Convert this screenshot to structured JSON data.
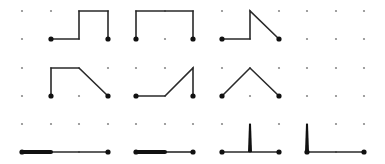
{
  "grid": {
    "columns_x": [
      22,
      51,
      79,
      108,
      136,
      165,
      193,
      222,
      250,
      279,
      307,
      336,
      364
    ],
    "rows_y": [
      11,
      39,
      68,
      96,
      124,
      152
    ],
    "dot_color": "#8a8a8a",
    "dot_radius": 1.1
  },
  "colors": {
    "line": "#2a2a2a",
    "endpoint": "#111111"
  },
  "panels": [
    {
      "id": "p1",
      "row": 1,
      "col": 1,
      "type": "polyline",
      "points": [
        [
          51,
          39
        ],
        [
          79,
          39
        ],
        [
          79,
          11
        ],
        [
          108,
          11
        ],
        [
          108,
          39
        ]
      ],
      "endpoints": [
        [
          51,
          39
        ],
        [
          108,
          39
        ]
      ]
    },
    {
      "id": "p2",
      "row": 1,
      "col": 2,
      "type": "polyline",
      "points": [
        [
          136,
          39
        ],
        [
          136,
          11
        ],
        [
          193,
          11
        ],
        [
          193,
          39
        ]
      ],
      "endpoints": [
        [
          136,
          39
        ],
        [
          193,
          39
        ]
      ]
    },
    {
      "id": "p3",
      "row": 1,
      "col": 3,
      "type": "polyline",
      "points": [
        [
          222,
          39
        ],
        [
          250,
          39
        ],
        [
          250,
          11
        ],
        [
          279,
          39
        ]
      ],
      "endpoints": [
        [
          222,
          39
        ],
        [
          279,
          39
        ]
      ]
    },
    {
      "id": "p4",
      "row": 1,
      "col": 4,
      "type": "empty"
    },
    {
      "id": "p5",
      "row": 2,
      "col": 1,
      "type": "polyline",
      "points": [
        [
          51,
          96
        ],
        [
          51,
          68
        ],
        [
          79,
          68
        ],
        [
          108,
          96
        ]
      ],
      "endpoints": [
        [
          51,
          96
        ],
        [
          108,
          96
        ]
      ]
    },
    {
      "id": "p6",
      "row": 2,
      "col": 2,
      "type": "polyline",
      "points": [
        [
          136,
          96
        ],
        [
          165,
          96
        ],
        [
          193,
          68
        ],
        [
          193,
          96
        ]
      ],
      "endpoints": [
        [
          136,
          96
        ],
        [
          193,
          96
        ]
      ]
    },
    {
      "id": "p7",
      "row": 2,
      "col": 3,
      "type": "polyline",
      "points": [
        [
          222,
          96
        ],
        [
          250,
          68
        ],
        [
          279,
          96
        ]
      ],
      "endpoints": [
        [
          222,
          96
        ],
        [
          279,
          96
        ]
      ]
    },
    {
      "id": "p8",
      "row": 2,
      "col": 4,
      "type": "empty"
    },
    {
      "id": "p9",
      "row": 3,
      "col": 1,
      "type": "collapsed-flat",
      "thick": [
        [
          22,
          152
        ],
        [
          51,
          152
        ]
      ],
      "thin": [
        [
          51,
          152
        ],
        [
          108,
          152
        ]
      ],
      "endpoints": [
        [
          22,
          152
        ],
        [
          108,
          152
        ]
      ]
    },
    {
      "id": "p10",
      "row": 3,
      "col": 2,
      "type": "collapsed-flat",
      "thick": [
        [
          136,
          152
        ],
        [
          165,
          152
        ]
      ],
      "thin": [
        [
          165,
          152
        ],
        [
          193,
          152
        ]
      ],
      "endpoints": [
        [
          136,
          152
        ],
        [
          193,
          152
        ]
      ]
    },
    {
      "id": "p11",
      "row": 3,
      "col": 3,
      "type": "collapsed-spike",
      "thin": [
        [
          222,
          152
        ],
        [
          279,
          152
        ]
      ],
      "spike": {
        "x": 250,
        "top": 124,
        "bottom": 152
      },
      "endpoints": [
        [
          222,
          152
        ],
        [
          279,
          152
        ]
      ]
    },
    {
      "id": "p12",
      "row": 3,
      "col": 4,
      "type": "collapsed-spike",
      "thin": [
        [
          307,
          152
        ],
        [
          364,
          152
        ]
      ],
      "spike": {
        "x": 307,
        "top": 124,
        "bottom": 152
      },
      "endpoints": [
        [
          307,
          152
        ],
        [
          364,
          152
        ]
      ]
    }
  ]
}
